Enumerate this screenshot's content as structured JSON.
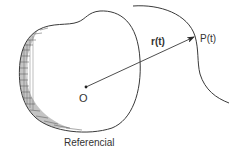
{
  "diagram": {
    "labels": {
      "origin": "O",
      "position_vector": "r(t)",
      "point": "P(t)",
      "reference_frame": "Referencial"
    },
    "colors": {
      "stroke": "#3a3a3a",
      "text": "#333333",
      "background": "#ffffff"
    }
  }
}
